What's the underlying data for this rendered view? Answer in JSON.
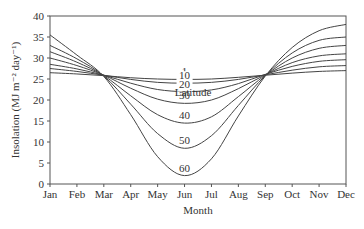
{
  "chart_data": {
    "type": "line",
    "title": "",
    "xlabel": "Month",
    "ylabel": "Insolation (MJ m⁻² day⁻¹)",
    "categories": [
      "Jan",
      "Feb",
      "Mar",
      "Apr",
      "May",
      "Jun",
      "Jul",
      "Aug",
      "Sep",
      "Oct",
      "Nov",
      "Dec"
    ],
    "ylim": [
      0,
      40
    ],
    "yticks": [
      0,
      5,
      10,
      15,
      20,
      25,
      30,
      35,
      40
    ],
    "grid": false,
    "legend_title": "Latitude",
    "series": [
      {
        "name": "1",
        "values": [
          26.5,
          26.2,
          25.8,
          25.3,
          25.0,
          24.9,
          25.0,
          25.4,
          25.9,
          26.4,
          26.8,
          27.0
        ]
      },
      {
        "name": "10",
        "values": [
          27.5,
          26.8,
          25.9,
          24.9,
          24.2,
          24.0,
          24.2,
          24.9,
          26.0,
          27.1,
          27.9,
          28.2
        ]
      },
      {
        "name": "20",
        "values": [
          28.5,
          27.4,
          25.9,
          24.0,
          22.5,
          22.0,
          22.4,
          23.9,
          26.1,
          28.0,
          29.2,
          29.6
        ]
      },
      {
        "name": "30",
        "values": [
          30.0,
          28.2,
          25.9,
          22.8,
          20.2,
          19.2,
          20.0,
          22.7,
          26.0,
          28.9,
          30.5,
          31.0
        ]
      },
      {
        "name": "40",
        "values": [
          31.5,
          29.0,
          25.8,
          21.0,
          16.5,
          14.5,
          16.0,
          20.8,
          25.9,
          30.0,
          32.3,
          33.0
        ]
      },
      {
        "name": "50",
        "values": [
          33.0,
          29.8,
          25.7,
          19.0,
          12.0,
          8.5,
          11.5,
          18.7,
          25.8,
          31.2,
          34.2,
          35.0
        ]
      },
      {
        "name": "60",
        "values": [
          35.5,
          30.7,
          25.6,
          16.5,
          6.5,
          2.0,
          6.0,
          16.2,
          25.7,
          32.5,
          36.5,
          38.0
        ]
      }
    ]
  }
}
